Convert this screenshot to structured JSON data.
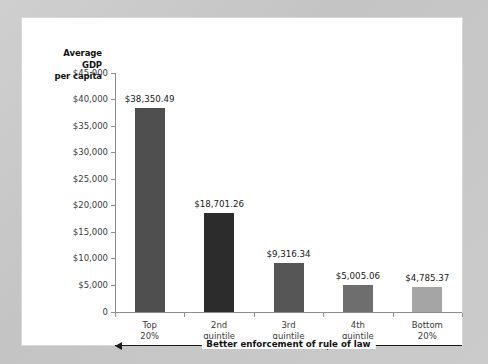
{
  "chart_data": {
    "type": "bar",
    "title": "",
    "subtitle": "",
    "xlabel": "",
    "ylabel": "Average GDP per capita",
    "ylabel_lines": [
      "Average",
      "GDP",
      "per capita"
    ],
    "categories": [
      "Top 20%",
      "2nd quintile",
      "3rd quintile",
      "4th quintile",
      "Bottom 20%"
    ],
    "category_lines": [
      [
        "Top",
        "20%"
      ],
      [
        "2nd",
        "quintile"
      ],
      [
        "3rd",
        "quintile"
      ],
      [
        "4th",
        "quintile"
      ],
      [
        "Bottom",
        "20%"
      ]
    ],
    "values": [
      38350.49,
      18701.26,
      9316.34,
      5005.06,
      4785.37
    ],
    "value_labels": [
      "$38,350.49",
      "$18,701.26",
      "$9,316.34",
      "$5,005.06",
      "$4,785.37"
    ],
    "bar_colors": [
      "#4f4f4f",
      "#2c2c2c",
      "#565656",
      "#6e6e6e",
      "#a5a5a5"
    ],
    "ylim": [
      0,
      45000
    ],
    "ytick_values": [
      45000,
      40000,
      35000,
      30000,
      25000,
      20000,
      15000,
      10000,
      5000,
      0
    ],
    "ytick_labels": [
      "$45,000",
      "$40,000",
      "$35,000",
      "$30,000",
      "$25,000",
      "$20,000",
      "$15,000",
      "$10,000",
      "$5,000",
      "0"
    ],
    "grid": false,
    "legend": false,
    "annotation": {
      "text": "Better enforcement of rule of law",
      "direction": "left"
    }
  },
  "colors": {
    "page_background": "#c9c9c9",
    "panel_background": "#ffffff",
    "axis": "#8d8d8d",
    "text": "#1a1a1a",
    "tick_text": "#3c3c3c"
  }
}
